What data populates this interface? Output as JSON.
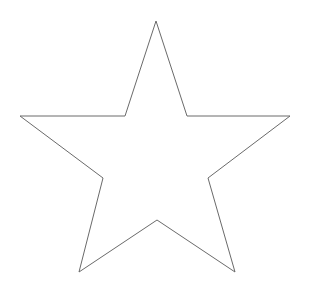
{
  "figure": {
    "name": "five-pointed-star-outline",
    "title": "Five-pointed star outline",
    "background_color": "#ffffff",
    "stroke_color": "#6a6a6a",
    "fill_color": "none",
    "stroke_width": 1,
    "canvas": {
      "width": 312,
      "height": 297
    }
  },
  "chart_data": {
    "type": "scatter",
    "title": "Five-pointed star outline",
    "subtitle": "",
    "xlabel": "",
    "ylabel": "",
    "xlim": [
      0,
      312
    ],
    "ylim": [
      0,
      297
    ],
    "grid": false,
    "legend": "none",
    "annotations": [],
    "shape": "star-5-point",
    "closed": true,
    "point_count": 10,
    "outer_point_labels": [
      "apex",
      "right",
      "bottom-right",
      "bottom-left",
      "left"
    ],
    "inner_point_labels": [
      "upper-right",
      "lower-right",
      "bottom-center",
      "lower-left",
      "upper-left"
    ],
    "x": [
      156,
      187,
      290,
      208,
      235,
      157,
      79,
      103,
      20,
      125
    ],
    "y": [
      21,
      116,
      116,
      178,
      272,
      220,
      272,
      178,
      116,
      116
    ],
    "points_path": "M 156,21 L 187,116 L 290,116 L 208,178 L 235,272 L 157,220 L 79,272 L 103,178 L 20,116 L 125,116 Z",
    "points_attr": "156,21 187,116 290,116 208,178 235,272 157,220 79,272 103,178 20,116 125,116"
  }
}
